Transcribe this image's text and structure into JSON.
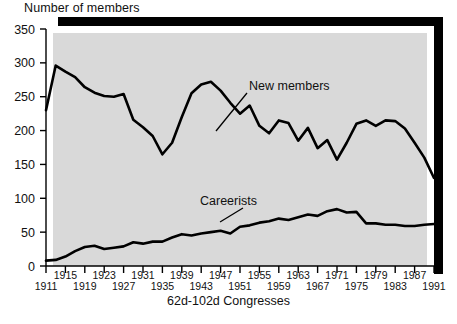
{
  "chart_data": {
    "type": "line",
    "title": "Number of members",
    "xlabel": "62d-102d Congresses",
    "ylabel": "Number of members",
    "ylim": [
      0,
      350
    ],
    "yticks": [
      0,
      50,
      100,
      150,
      200,
      250,
      300,
      350
    ],
    "xlim": [
      1911,
      1991
    ],
    "xticks": [
      1911,
      1915,
      1919,
      1923,
      1927,
      1931,
      1935,
      1939,
      1943,
      1947,
      1951,
      1955,
      1959,
      1963,
      1967,
      1971,
      1975,
      1979,
      1983,
      1987,
      1991
    ],
    "grid": false,
    "legend_position": "inline-annotation",
    "x": [
      1911,
      1913,
      1915,
      1917,
      1919,
      1921,
      1923,
      1925,
      1927,
      1929,
      1931,
      1933,
      1935,
      1937,
      1939,
      1941,
      1943,
      1945,
      1947,
      1949,
      1951,
      1953,
      1955,
      1957,
      1959,
      1961,
      1963,
      1965,
      1967,
      1969,
      1971,
      1973,
      1975,
      1977,
      1979,
      1981,
      1983,
      1985,
      1987,
      1989,
      1991
    ],
    "series": [
      {
        "name": "New members",
        "values": [
          230,
          296,
          287,
          279,
          264,
          256,
          251,
          250,
          254,
          216,
          205,
          192,
          165,
          182,
          220,
          255,
          268,
          272,
          259,
          241,
          225,
          237,
          207,
          196,
          215,
          211,
          185,
          204,
          174,
          186,
          157,
          182,
          210,
          215,
          207,
          215,
          214,
          203,
          182,
          160,
          130
        ]
      },
      {
        "name": "Careerists",
        "values": [
          8,
          9,
          14,
          22,
          28,
          30,
          25,
          27,
          29,
          35,
          33,
          36,
          36,
          42,
          47,
          45,
          48,
          50,
          52,
          48,
          58,
          60,
          64,
          66,
          70,
          68,
          72,
          76,
          74,
          81,
          84,
          79,
          80,
          63,
          63,
          61,
          61,
          59,
          59,
          61,
          62
        ]
      }
    ],
    "annotations": [
      {
        "text": "New members",
        "x": 1955,
        "y": 290
      },
      {
        "text": "Careerists",
        "x": 1943,
        "y": 112
      }
    ]
  },
  "style": {
    "plot_background": "#d9d9d9",
    "line_color": "#000000",
    "frame_shadow": "#000000",
    "page_background": "#ffffff"
  }
}
